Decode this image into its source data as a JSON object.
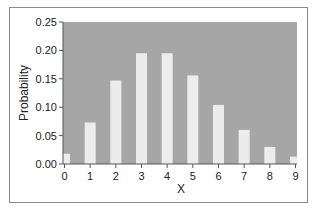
{
  "chart_data": {
    "type": "bar",
    "title": "",
    "xlabel": "X",
    "ylabel": "Probability",
    "categories": [
      "0",
      "1",
      "2",
      "3",
      "4",
      "5",
      "6",
      "7",
      "8",
      "9"
    ],
    "x": [
      0,
      1,
      2,
      3,
      4,
      5,
      6,
      7,
      8,
      9
    ],
    "values": [
      0.018,
      0.073,
      0.147,
      0.195,
      0.195,
      0.156,
      0.104,
      0.06,
      0.03,
      0.013
    ],
    "ylim": [
      0,
      0.25
    ],
    "xlim": [
      0,
      9
    ],
    "yticks": [
      "0.00",
      "0.05",
      "0.10",
      "0.15",
      "0.20",
      "0.25"
    ],
    "xticks": [
      "0",
      "1",
      "2",
      "3",
      "4",
      "5",
      "6",
      "7",
      "8",
      "9"
    ],
    "grid": false,
    "legend": null,
    "colors": {
      "plot_background": "#a6a6a6",
      "bar_fill": "#ececec",
      "axis": "#555555",
      "text": "#222222"
    }
  }
}
